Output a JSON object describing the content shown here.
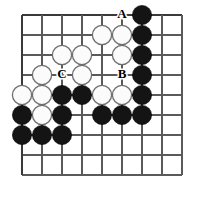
{
  "figure": {
    "kind": "go-board-diagram",
    "board": {
      "columns": 9,
      "rows": 9,
      "origin_x": 22,
      "origin_y": 15,
      "spacing": 20,
      "line_color": "#5a5a5a",
      "edge_color": "#3a3a3a",
      "background_color": "#ffffff"
    },
    "colors": {
      "black_stone": "#141414",
      "white_stone": "#fbfbfb",
      "white_stone_outline": "#6e6e6e",
      "label_text": "#000000"
    },
    "stone_radius": 9.6
  },
  "stones": [
    {
      "color": "black",
      "col": 7,
      "row": 1
    },
    {
      "color": "white",
      "col": 5,
      "row": 2
    },
    {
      "color": "white",
      "col": 6,
      "row": 2
    },
    {
      "color": "black",
      "col": 7,
      "row": 2
    },
    {
      "color": "white",
      "col": 3,
      "row": 3
    },
    {
      "color": "white",
      "col": 4,
      "row": 3
    },
    {
      "color": "white",
      "col": 6,
      "row": 3
    },
    {
      "color": "black",
      "col": 7,
      "row": 3
    },
    {
      "color": "white",
      "col": 2,
      "row": 4
    },
    {
      "color": "white",
      "col": 4,
      "row": 4
    },
    {
      "color": "black",
      "col": 7,
      "row": 4
    },
    {
      "color": "white",
      "col": 1,
      "row": 5
    },
    {
      "color": "white",
      "col": 2,
      "row": 5
    },
    {
      "color": "black",
      "col": 3,
      "row": 5
    },
    {
      "color": "black",
      "col": 4,
      "row": 5
    },
    {
      "color": "white",
      "col": 5,
      "row": 5
    },
    {
      "color": "white",
      "col": 6,
      "row": 5
    },
    {
      "color": "black",
      "col": 7,
      "row": 5
    },
    {
      "color": "black",
      "col": 1,
      "row": 6
    },
    {
      "color": "white",
      "col": 2,
      "row": 6
    },
    {
      "color": "black",
      "col": 3,
      "row": 6
    },
    {
      "color": "black",
      "col": 5,
      "row": 6
    },
    {
      "color": "black",
      "col": 6,
      "row": 6
    },
    {
      "color": "black",
      "col": 7,
      "row": 6
    },
    {
      "color": "black",
      "col": 1,
      "row": 7
    },
    {
      "color": "black",
      "col": 2,
      "row": 7
    },
    {
      "color": "black",
      "col": 3,
      "row": 7
    }
  ],
  "labels": [
    {
      "text": "A",
      "col": 6,
      "row": 1
    },
    {
      "text": "B",
      "col": 6,
      "row": 4
    },
    {
      "text": "C",
      "col": 3,
      "row": 4
    }
  ]
}
